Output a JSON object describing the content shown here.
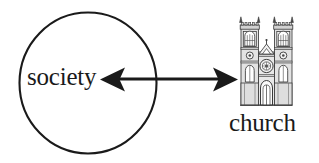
{
  "diagram": {
    "type": "relationship-diagram",
    "background_color": "#ffffff",
    "stroke_color": "#1a1a1a",
    "nodes": [
      {
        "id": "society",
        "label": "society",
        "shape": "circle",
        "center_x": 88,
        "center_y": 83,
        "radius_x": 69,
        "radius_y": 71
      },
      {
        "id": "church",
        "label": "church",
        "shape": "cathedral-illustration",
        "icon": "church-icon",
        "x": 240,
        "y": 17,
        "width": 52,
        "height": 88
      }
    ],
    "connector": {
      "id": "society-church-connector",
      "type": "double-headed-arrow",
      "from": "society",
      "to": "church",
      "x1": 100,
      "x2": 238,
      "y": 79,
      "line_width": 3,
      "arrowhead_left": true,
      "arrowhead_right": true
    }
  }
}
